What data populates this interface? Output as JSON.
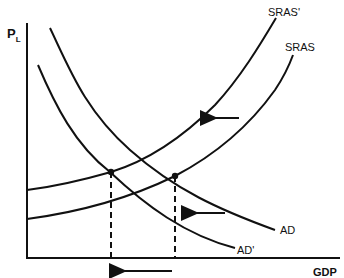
{
  "diagram": {
    "type": "AD-AS economic diagram",
    "y_axis_label": "P",
    "y_axis_label_subscript": "L",
    "x_axis_label": "GDP",
    "curves": [
      {
        "id": "ad",
        "label": "AD"
      },
      {
        "id": "ad_prime",
        "label": "AD'"
      },
      {
        "id": "sras",
        "label": "SRAS"
      },
      {
        "id": "sras_prime",
        "label": "SRAS'"
      }
    ],
    "equilibria": [
      {
        "id": "new",
        "description": "AD' meets SRAS'"
      },
      {
        "id": "original",
        "description": "AD meets SRAS"
      }
    ],
    "arrows": [
      {
        "id": "sras-shift",
        "direction": "left"
      },
      {
        "id": "ad-shift",
        "direction": "left"
      },
      {
        "id": "gdp-shift",
        "direction": "left"
      }
    ],
    "colors": {
      "line": "#111111",
      "background": "#ffffff"
    }
  }
}
